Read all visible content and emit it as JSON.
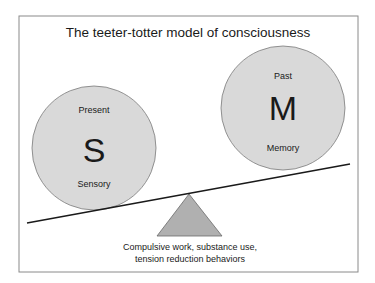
{
  "title": "The teeter-totter model of consciousness",
  "left_circle": {
    "top_label": "Present",
    "letter": "S",
    "bottom_label": "Sensory"
  },
  "right_circle": {
    "top_label": "Past",
    "letter": "M",
    "bottom_label": "Memory"
  },
  "fulcrum": {
    "caption_line1": "Compulsive work, substance use,",
    "caption_line2": "tension reduction behaviors"
  },
  "colors": {
    "circle_fill": "#d9d9d9",
    "fulcrum_fill": "#b0b0b0",
    "border": "#888888",
    "line": "#1a1a1a"
  }
}
